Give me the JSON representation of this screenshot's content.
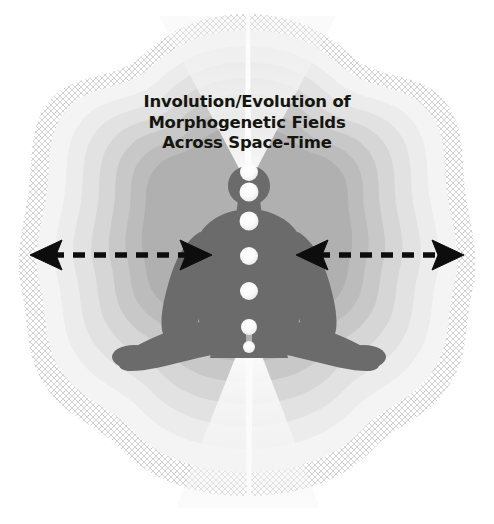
{
  "figure": {
    "kind": "conceptual-diagram",
    "canvas": {
      "width": 494,
      "height": 524,
      "background": "#ffffff"
    },
    "title": {
      "lines": [
        "Involution/Evolution of",
        "Morphogenetic Fields",
        "Across Space-Time"
      ],
      "color": "#15150f",
      "align": "center"
    },
    "palette": {
      "background": "#ffffff",
      "mesh_edge": "#d8d8d8",
      "ring_1_outermost": "#f4f4f4",
      "ring_2": "#ececec",
      "ring_3": "#e2e2e2",
      "ring_4": "#d6d6d6",
      "ring_5": "#c8c8c8",
      "ring_6": "#bcbcbc",
      "ring_7_innermost": "#b0b0b0",
      "body_figure": "#6b6b6b",
      "light_cone": "#f2f2f2",
      "chakra": "#fbfbfb",
      "arrow": "#0d0d0d"
    },
    "rings": {
      "count": 7,
      "shape": "wavy-lobed-concentric",
      "note": "nested undulating field shells, lightest at outer edge, darkest nearest the body"
    },
    "light_cones": {
      "upward": {
        "origin": "crown",
        "direction": "up",
        "widens": true
      },
      "downward": {
        "origin": "base",
        "direction": "down",
        "widens": true
      },
      "axis": {
        "description": "thin vertical bright line through center",
        "color": "#fafafa"
      }
    },
    "chakras": [
      {
        "label": "crown",
        "cx": 249,
        "cy": 172,
        "r": 9.0
      },
      {
        "label": "third-eye",
        "cx": 249,
        "cy": 192,
        "r": 9.5
      },
      {
        "label": "throat",
        "cx": 249,
        "cy": 221,
        "r": 9.5
      },
      {
        "label": "heart",
        "cx": 249,
        "cy": 256,
        "r": 9.0
      },
      {
        "label": "solar-plexus",
        "cx": 249,
        "cy": 291,
        "r": 9.0
      },
      {
        "label": "sacral",
        "cx": 249,
        "cy": 327,
        "r": 8.0
      },
      {
        "label": "root",
        "cx": 249,
        "cy": 347,
        "r": 6.0
      }
    ],
    "arrows": [
      {
        "name": "left-expansion-arrow",
        "double_headed": true,
        "style": "dashed",
        "x_start": 32,
        "x_end": 208,
        "y": 255,
        "color": "#0d0d0d"
      },
      {
        "name": "right-expansion-arrow",
        "double_headed": true,
        "style": "dashed",
        "x_start": 296,
        "x_end": 462,
        "y": 255,
        "color": "#0d0d0d"
      }
    ]
  }
}
